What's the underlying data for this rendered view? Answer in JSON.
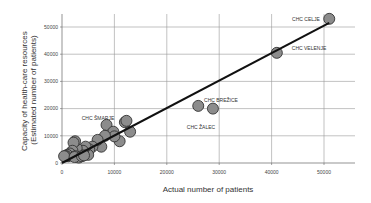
{
  "chart_data": {
    "type": "scatter",
    "title": "",
    "xlabel": "Actual number of patients",
    "ylabel": "Capacity of health-care resources (Estimated number of patients)",
    "ylabel_lines": [
      "Capacity of health-care resources",
      "(Estimated number of patients)"
    ],
    "xlim": [
      0,
      55000
    ],
    "ylim": [
      0,
      55000
    ],
    "x_ticks": [
      0,
      10000,
      20000,
      30000,
      40000,
      50000
    ],
    "y_ticks": [
      0,
      10000,
      20000,
      30000,
      40000,
      50000
    ],
    "grid": true,
    "legend": "none",
    "marker": {
      "shape": "circle",
      "fill": "#8c8c8c",
      "stroke": "#333333"
    },
    "regression_line": {
      "x": [
        0,
        51000
      ],
      "y": [
        0,
        51500
      ],
      "color": "#111111"
    },
    "points": [
      {
        "x": 51000,
        "y": 53000,
        "label": "CHC CELJE"
      },
      {
        "x": 41000,
        "y": 40500,
        "label": "CHC VELENJE"
      },
      {
        "x": 26000,
        "y": 21000,
        "label": "CHC BREŽICE"
      },
      {
        "x": 28800,
        "y": 20000,
        "label": "CHC ŽALEC"
      },
      {
        "x": 8500,
        "y": 14000,
        "label": "CHC ŠMARJE"
      },
      {
        "x": 12000,
        "y": 15000
      },
      {
        "x": 12300,
        "y": 15500
      },
      {
        "x": 13000,
        "y": 11500
      },
      {
        "x": 11000,
        "y": 8000
      },
      {
        "x": 9800,
        "y": 11500
      },
      {
        "x": 10000,
        "y": 9800
      },
      {
        "x": 8200,
        "y": 10000
      },
      {
        "x": 7500,
        "y": 6000
      },
      {
        "x": 6800,
        "y": 8500
      },
      {
        "x": 5800,
        "y": 6000
      },
      {
        "x": 5200,
        "y": 5000
      },
      {
        "x": 5000,
        "y": 3000
      },
      {
        "x": 4500,
        "y": 6000
      },
      {
        "x": 4000,
        "y": 4500
      },
      {
        "x": 3500,
        "y": 3000
      },
      {
        "x": 3000,
        "y": 3000
      },
      {
        "x": 2800,
        "y": 5500
      },
      {
        "x": 2500,
        "y": 8000
      },
      {
        "x": 2200,
        "y": 7500
      },
      {
        "x": 2000,
        "y": 4500
      },
      {
        "x": 1800,
        "y": 3000
      },
      {
        "x": 1500,
        "y": 3500
      },
      {
        "x": 1200,
        "y": 2500
      },
      {
        "x": 1000,
        "y": 3000
      },
      {
        "x": 800,
        "y": 2500
      },
      {
        "x": 600,
        "y": 2500
      },
      {
        "x": 400,
        "y": 2500
      },
      {
        "x": 2600,
        "y": 2500
      },
      {
        "x": 3200,
        "y": 2000
      },
      {
        "x": 2400,
        "y": 2200
      },
      {
        "x": 3800,
        "y": 2500
      },
      {
        "x": 4200,
        "y": 2800
      }
    ],
    "annotations": [
      {
        "text": "CHC CELJE",
        "x": 306,
        "y": 21,
        "anchor": "middle"
      },
      {
        "text": "CHC VELENJE",
        "x": 309,
        "y": 50,
        "anchor": "middle"
      },
      {
        "text": "CHC BREŽICE",
        "x": 221,
        "y": 102,
        "anchor": "middle"
      },
      {
        "text": "CHC ŽALEC",
        "x": 201,
        "y": 129,
        "anchor": "middle"
      },
      {
        "text": "CHC ŠMARJE",
        "x": 98,
        "y": 120,
        "anchor": "middle"
      }
    ]
  },
  "layout": {
    "plot": {
      "left": 62,
      "right": 355,
      "top": 14,
      "bottom": 163
    },
    "x_scale": 0.00524,
    "y_scale": 0.00272
  }
}
